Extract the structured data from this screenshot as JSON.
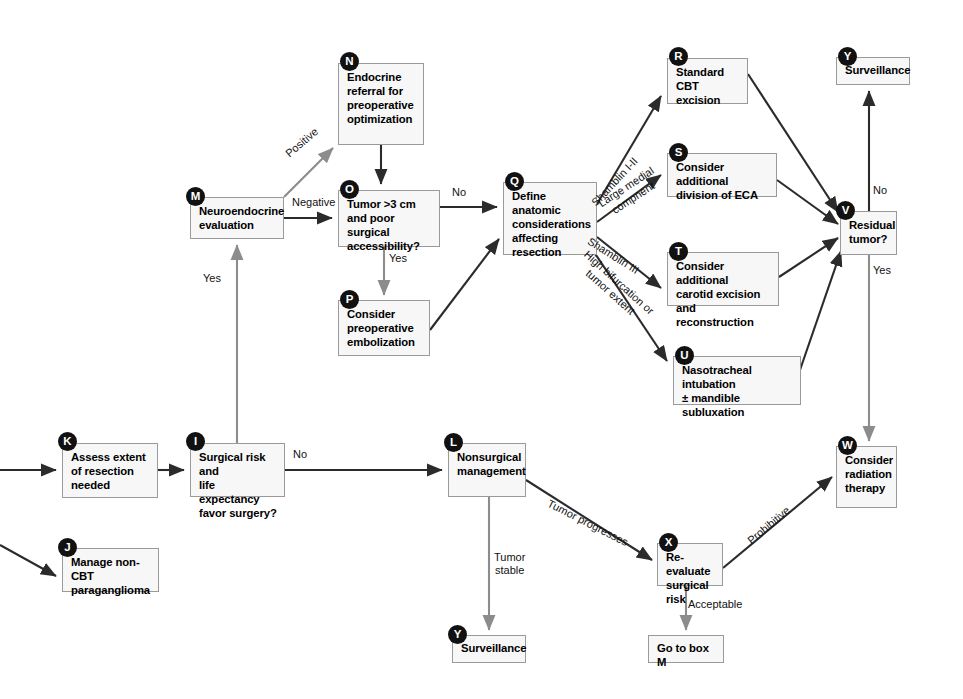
{
  "colors": {
    "box_fill": "#f7f7f7",
    "box_border": "#9a9a9a",
    "badge_fill": "#111111",
    "badge_text": "#ffffff",
    "arrow_dark": "#2b2b2b",
    "arrow_gray": "#8c8c8c",
    "background": "#ffffff"
  },
  "nodes": [
    {
      "id": "K",
      "badge": "K",
      "label": "Assess extent\nof resection\nneeded",
      "x": 62,
      "y": 443,
      "w": 96,
      "h": 55
    },
    {
      "id": "J",
      "badge": "J",
      "label": "Manage non-CBT\nparaganglioma",
      "x": 62,
      "y": 548,
      "w": 97,
      "h": 44
    },
    {
      "id": "I",
      "badge": "I",
      "label": "Surgical risk and\nlife expectancy\nfavor surgery?",
      "x": 190,
      "y": 443,
      "w": 95,
      "h": 54
    },
    {
      "id": "M",
      "badge": "M",
      "label": "Neuroendocrine\nevaluation",
      "x": 190,
      "y": 197,
      "w": 94,
      "h": 42
    },
    {
      "id": "N",
      "badge": "N",
      "label": "Endocrine\nreferral for\npreoperative\noptimization",
      "x": 338,
      "y": 63,
      "w": 86,
      "h": 82
    },
    {
      "id": "O",
      "badge": "O",
      "label": "Tumor >3 cm\nand poor surgical\naccessibility?",
      "x": 338,
      "y": 190,
      "w": 102,
      "h": 57
    },
    {
      "id": "P",
      "badge": "P",
      "label": "Consider\npreoperative\nembolization",
      "x": 338,
      "y": 300,
      "w": 92,
      "h": 56
    },
    {
      "id": "Q",
      "badge": "Q",
      "label": "Define anatomic\nconsiderations\naffecting\nresection",
      "x": 503,
      "y": 182,
      "w": 94,
      "h": 73
    },
    {
      "id": "L",
      "badge": "L",
      "label": "Nonsurgical\nmanagement",
      "x": 448,
      "y": 443,
      "w": 78,
      "h": 54
    },
    {
      "id": "R",
      "badge": "R",
      "label": "Standard\nCBT excision",
      "x": 667,
      "y": 58,
      "w": 81,
      "h": 46
    },
    {
      "id": "S",
      "badge": "S",
      "label": "Consider additional\ndivision of ECA",
      "x": 667,
      "y": 153,
      "w": 110,
      "h": 44
    },
    {
      "id": "T",
      "badge": "T",
      "label": "Consider additional\ncarotid excision\nand reconstruction",
      "x": 667,
      "y": 252,
      "w": 112,
      "h": 54
    },
    {
      "id": "U",
      "badge": "U",
      "label": "Nasotracheal intubation\n± mandible subluxation",
      "x": 673,
      "y": 356,
      "w": 128,
      "h": 49
    },
    {
      "id": "Y1",
      "badge": "Y",
      "label": "Surveillance",
      "x": 836,
      "y": 57,
      "w": 74,
      "h": 28
    },
    {
      "id": "V",
      "badge": "V",
      "label": "Residual\ntumor?",
      "x": 840,
      "y": 211,
      "w": 57,
      "h": 44
    },
    {
      "id": "W",
      "badge": "W",
      "label": "Consider\nradiation\ntherapy",
      "x": 836,
      "y": 446,
      "w": 61,
      "h": 62
    },
    {
      "id": "X",
      "badge": "X",
      "label": "Re-evaluate\nsurgical risk",
      "x": 657,
      "y": 543,
      "w": 66,
      "h": 43
    },
    {
      "id": "Y2",
      "badge": "Y",
      "label": "Surveillance",
      "x": 452,
      "y": 635,
      "w": 74,
      "h": 28
    },
    {
      "id": "Z",
      "badge": "",
      "label": "Go to box M",
      "x": 648,
      "y": 635,
      "w": 76,
      "h": 28
    }
  ],
  "edge_labels": [
    {
      "id": "positive",
      "text": "Positive",
      "x": 283,
      "y": 150,
      "rot": -40
    },
    {
      "id": "negative",
      "text": "Negative",
      "x": 292,
      "y": 199,
      "rot": 0
    },
    {
      "id": "yes-to-m",
      "text": "Yes",
      "x": 203,
      "y": 272,
      "rot": 0
    },
    {
      "id": "no-o-to-q",
      "text": "No",
      "x": 455,
      "y": 190,
      "rot": 0
    },
    {
      "id": "yes-o-to-p",
      "text": "Yes",
      "x": 389,
      "y": 252,
      "rot": 0
    },
    {
      "id": "shamblin-1-2",
      "text": "Shamblin I-II",
      "x": 588,
      "y": 198,
      "rot": -47
    },
    {
      "id": "large-medial",
      "text": "Large medial\ncompnent",
      "x": 594,
      "y": 196,
      "rot": -33
    },
    {
      "id": "shamblin-3",
      "text": "Shamblin III",
      "x": 592,
      "y": 263,
      "rot": 32
    },
    {
      "id": "high-bifurcation",
      "text": "High bifurcation or\ntumor extent",
      "x": 589,
      "y": 276,
      "rot": 42
    },
    {
      "id": "no-v-to-y",
      "text": "No",
      "x": 869,
      "y": 188,
      "rot": 0
    },
    {
      "id": "yes-v-to-w",
      "text": "Yes",
      "x": 868,
      "y": 266,
      "rot": 0
    },
    {
      "id": "no-i-to-l",
      "text": "No",
      "x": 293,
      "y": 450,
      "rot": 0
    },
    {
      "id": "tumor-progresses",
      "text": "Tumor progresses",
      "x": 551,
      "y": 500,
      "rot": 27
    },
    {
      "id": "tumor-stable",
      "text": "Tumor\nstable",
      "x": 492,
      "y": 551,
      "rot": 0
    },
    {
      "id": "prohibitive",
      "text": "Prohibitive",
      "x": 748,
      "y": 532,
      "rot": -40
    },
    {
      "id": "acceptable",
      "text": "Acceptable",
      "x": 688,
      "y": 600,
      "rot": 0
    }
  ],
  "edges": [
    {
      "id": "in-to-k",
      "from": "left-margin",
      "to": "K",
      "style": "dark"
    },
    {
      "id": "in-to-j",
      "from": "left-margin",
      "to": "J",
      "style": "dark"
    },
    {
      "id": "k-to-i",
      "from": "K",
      "to": "I",
      "style": "dark"
    },
    {
      "id": "i-to-m",
      "from": "I",
      "to": "M",
      "style": "gray"
    },
    {
      "id": "m-to-n",
      "from": "M",
      "to": "N",
      "style": "gray"
    },
    {
      "id": "m-to-o",
      "from": "M",
      "to": "O",
      "style": "dark"
    },
    {
      "id": "n-to-o",
      "from": "N",
      "to": "O",
      "style": "dark"
    },
    {
      "id": "o-to-q",
      "from": "O",
      "to": "Q",
      "style": "dark"
    },
    {
      "id": "o-to-p",
      "from": "O",
      "to": "P",
      "style": "gray"
    },
    {
      "id": "p-to-q",
      "from": "P",
      "to": "Q",
      "style": "dark"
    },
    {
      "id": "q-to-r",
      "from": "Q",
      "to": "R",
      "style": "dark"
    },
    {
      "id": "q-to-s",
      "from": "Q",
      "to": "S",
      "style": "dark"
    },
    {
      "id": "q-to-t",
      "from": "Q",
      "to": "T",
      "style": "dark"
    },
    {
      "id": "q-to-u",
      "from": "Q",
      "to": "U",
      "style": "dark"
    },
    {
      "id": "r-to-v",
      "from": "R",
      "to": "V",
      "style": "dark"
    },
    {
      "id": "s-to-v",
      "from": "S",
      "to": "V",
      "style": "dark"
    },
    {
      "id": "t-to-v",
      "from": "T",
      "to": "V",
      "style": "dark"
    },
    {
      "id": "u-to-v",
      "from": "U",
      "to": "V",
      "style": "dark"
    },
    {
      "id": "v-to-y",
      "from": "V",
      "to": "Y1",
      "style": "dark"
    },
    {
      "id": "v-to-w",
      "from": "V",
      "to": "W",
      "style": "gray"
    },
    {
      "id": "i-to-l",
      "from": "I",
      "to": "L",
      "style": "dark"
    },
    {
      "id": "l-to-x",
      "from": "L",
      "to": "X",
      "style": "dark"
    },
    {
      "id": "l-to-y2",
      "from": "L",
      "to": "Y2",
      "style": "gray"
    },
    {
      "id": "x-to-w",
      "from": "X",
      "to": "W",
      "style": "dark"
    },
    {
      "id": "x-to-z",
      "from": "X",
      "to": "Z",
      "style": "gray"
    }
  ]
}
